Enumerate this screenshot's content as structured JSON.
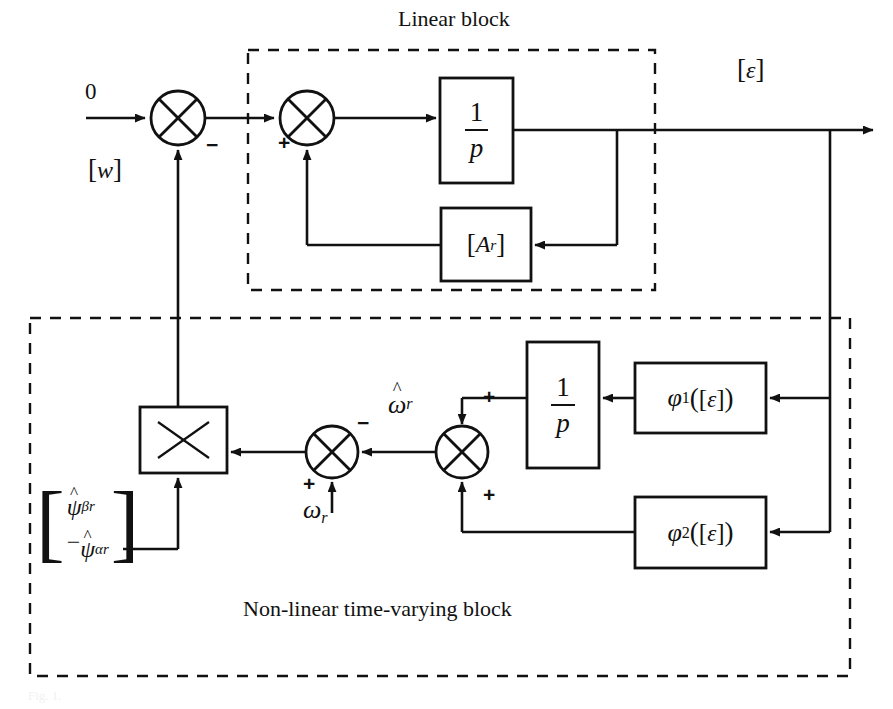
{
  "figure": {
    "type": "control-block-diagram",
    "background": "#ffffff",
    "line_color": "#111111",
    "width": 893,
    "height": 709
  },
  "groups": {
    "linear_block": {
      "title": "Linear block",
      "title_x": 398,
      "title_y": 18,
      "box": {
        "x": 248,
        "y": 50,
        "w": 407,
        "h": 240
      }
    },
    "nonlinear_block": {
      "title": "Non-linear time-varying block",
      "title_x": 380,
      "title_y": 608,
      "box": {
        "x": 30,
        "y": 318,
        "w": 820,
        "h": 358
      }
    }
  },
  "signals": {
    "input_zero": "0",
    "feedback_w": "[w]",
    "output_epsilon": "[ε]",
    "omega_r_hat": "ω̂r",
    "omega_r": "ωr"
  },
  "blocks": {
    "integrator_top": {
      "label": "1/p",
      "numerator": "1",
      "denominator": "p",
      "x": 440,
      "y": 78,
      "w": 73,
      "h": 105
    },
    "a_r": {
      "label": "[Ar]",
      "base": "A",
      "sub": "r",
      "x": 441,
      "y": 208,
      "w": 90,
      "h": 73
    },
    "multiplier": {
      "label": "×",
      "x": 140,
      "y": 407,
      "w": 87,
      "h": 66
    },
    "integrator_bottom": {
      "label": "1/p",
      "numerator": "1",
      "denominator": "p",
      "x": 527,
      "y": 342,
      "w": 72,
      "h": 126
    },
    "phi_1": {
      "label": "φ1([ε])",
      "base": "φ",
      "sub": "1",
      "arg": "([ε])",
      "x": 635,
      "y": 363,
      "w": 131,
      "h": 70
    },
    "phi_2": {
      "label": "φ2([ε])",
      "base": "φ",
      "sub": "2",
      "arg": "([ε])",
      "x": 635,
      "y": 497,
      "w": 131,
      "h": 71
    }
  },
  "summing_junctions": [
    {
      "name": "sum-outer-error",
      "cx": 178,
      "cy": 118,
      "r": 27,
      "signs": [
        {
          "text": "-",
          "x": 208,
          "y": 146
        }
      ]
    },
    {
      "name": "sum-linear-state",
      "cx": 307,
      "cy": 118,
      "r": 27,
      "signs": [
        {
          "text": "+",
          "x": 281,
          "y": 143
        }
      ]
    },
    {
      "name": "sum-speed-error",
      "cx": 332,
      "cy": 452,
      "r": 26,
      "signs": [
        {
          "text": "-",
          "x": 360,
          "y": 424
        },
        {
          "text": "+",
          "x": 305,
          "y": 485
        }
      ]
    },
    {
      "name": "sum-adaptation",
      "cx": 462,
      "cy": 452,
      "r": 26,
      "signs": [
        {
          "text": "+",
          "x": 485,
          "y": 398
        },
        {
          "text": "+",
          "x": 485,
          "y": 495
        }
      ]
    }
  ],
  "matrix": {
    "name": "psi-vector",
    "x": 36,
    "y": 492,
    "rows": [
      "ψ̂βr",
      "−ψ̂αr"
    ],
    "row_bases": [
      "ψ",
      "−ψ"
    ],
    "row_subs": [
      "βr",
      "αr"
    ]
  },
  "labels": {
    "zero": {
      "text": "0",
      "x": 85,
      "y": 86
    },
    "w": {
      "text": "[w]",
      "x": 88,
      "y": 172
    },
    "epsilon_out": {
      "text": "[ε]",
      "x": 737,
      "y": 63
    },
    "omega_hat": {
      "text": "ω̂r",
      "x": 394,
      "y": 394
    },
    "omega": {
      "text": "ωr",
      "x": 305,
      "y": 505
    }
  },
  "caption": {
    "text": "Fig. 1."
  }
}
